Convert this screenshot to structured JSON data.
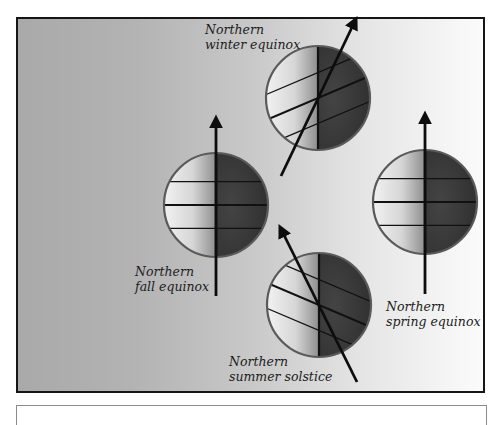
{
  "diagram": {
    "colors": {
      "frame_border": "#151515",
      "globe_rim": "#5a5a5a",
      "dark_side": "#3a3a3a",
      "axis": "#0d0d0d",
      "label_text": "#1c1c1c"
    },
    "labels": [
      {
        "id": "winter",
        "line1": "Northern",
        "line2": "winter equinox",
        "x": 205,
        "y": 34
      },
      {
        "id": "fall",
        "line1": "Northern",
        "line2": "fall equinox",
        "x": 135,
        "y": 276
      },
      {
        "id": "spring",
        "line1": "Northern",
        "line2": "spring equinox",
        "x": 386,
        "y": 311
      },
      {
        "id": "summer",
        "line1": "Northern",
        "line2": "summer solstice",
        "x": 229,
        "y": 366
      }
    ],
    "globes": [
      {
        "id": "winter",
        "cx": 318,
        "cy": 98,
        "r": 52,
        "tilt_deg": -23
      },
      {
        "id": "fall",
        "cx": 216,
        "cy": 205,
        "r": 52,
        "tilt_deg": 0
      },
      {
        "id": "spring",
        "cx": 425,
        "cy": 202,
        "r": 52,
        "tilt_deg": 0
      },
      {
        "id": "summer",
        "cx": 319,
        "cy": 305,
        "r": 52,
        "tilt_deg": 23
      }
    ],
    "axes": [
      {
        "id": "winter",
        "x1": 281,
        "y1": 176,
        "x2": 355,
        "y2": 21
      },
      {
        "id": "fall",
        "x1": 216,
        "y1": 296,
        "x2": 216,
        "y2": 120
      },
      {
        "id": "spring",
        "x1": 425,
        "y1": 294,
        "x2": 425,
        "y2": 116
      },
      {
        "id": "summer",
        "x1": 357,
        "y1": 382,
        "x2": 281,
        "y2": 229
      }
    ]
  },
  "caption_panel": {
    "text": ""
  }
}
